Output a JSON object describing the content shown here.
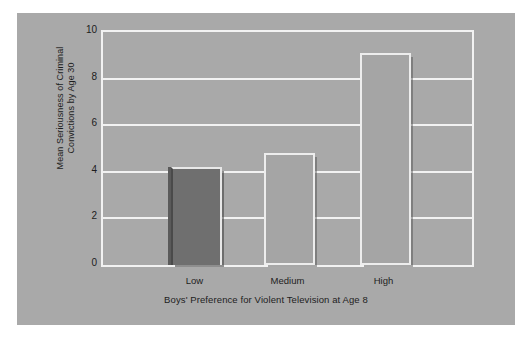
{
  "chart_data": {
    "type": "bar",
    "title": "",
    "subtitle": "",
    "categories": [
      "Low",
      "Medium",
      "High"
    ],
    "values": [
      4.2,
      4.8,
      9.1
    ],
    "series": [
      {
        "name": "Mean Seriousness of Criminal Convictions by Age 30",
        "values": [
          4.2,
          4.8,
          9.1
        ]
      }
    ],
    "xlabel": "Boys' Preference for Violent Television at Age 8",
    "ylabel_line1": "Mean Seriousness of Criminal",
    "ylabel_line2": "Convictions by Age 30",
    "ylabel": "Mean Seriousness of Criminal Convictions by Age 30",
    "ylim": [
      0,
      10
    ],
    "yticks": [
      10,
      8,
      6,
      4,
      2,
      0
    ],
    "ytick_labels": [
      "10",
      "8",
      "6",
      "4",
      "2",
      "0"
    ],
    "grid": true,
    "grid_axis": "y",
    "legend": false,
    "legend_position": "none",
    "bar_styles": [
      "filled-dark",
      "outlined-light",
      "outlined-light"
    ]
  },
  "colors": {
    "figure_background": "#a9a9a9",
    "page_background": "#ffffff",
    "plot_background": "#a9a9a9",
    "gridline": "#f2f2f2",
    "frame": "#f2f2f2",
    "bar_dark_fill": "#6f6f6f",
    "bar_light_fill": "#a5a5a5",
    "bar_outline": "#ededed",
    "text": "#1d1d1d"
  }
}
